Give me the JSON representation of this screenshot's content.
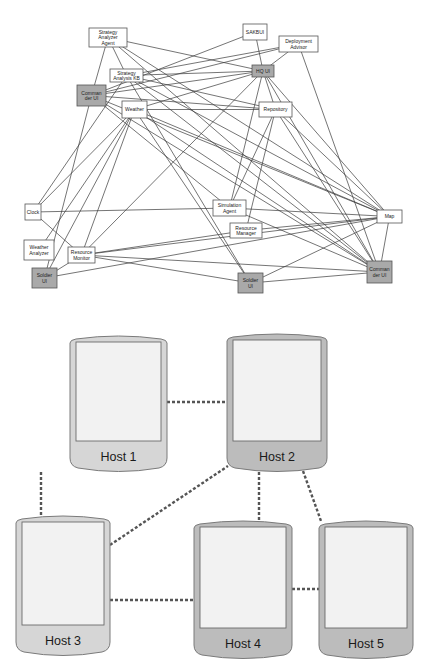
{
  "colors": {
    "edge": "#3a3a3a",
    "node_fill": "#ffffff",
    "node_stroke": "#555555",
    "ui_node_fill": "#a9a9a9",
    "host_shell_light": "#d6d6d6",
    "host_shell_dark": "#bcbcbc",
    "host_screen": "#f2f2f2",
    "host_stroke": "#7a7a7a",
    "dash": "#555555"
  },
  "agent_graph": {
    "nodes": [
      {
        "id": "sa_agent",
        "label": [
          "Strategy",
          "Analyzer",
          "Agent"
        ],
        "x": 89,
        "y": 28,
        "w": 38,
        "h": 19,
        "ui": false
      },
      {
        "id": "sakbui",
        "label": [
          "SAKBUI"
        ],
        "x": 243,
        "y": 24,
        "w": 24,
        "h": 16,
        "ui": false
      },
      {
        "id": "deploy",
        "label": [
          "Deployment",
          "Advisor"
        ],
        "x": 279,
        "y": 36,
        "w": 39,
        "h": 16,
        "ui": false
      },
      {
        "id": "sa_kb",
        "label": [
          "Strategy",
          "Analysis KB"
        ],
        "x": 110,
        "y": 69,
        "w": 33,
        "h": 13,
        "ui": false
      },
      {
        "id": "hq_ui",
        "label": [
          "HQ UI"
        ],
        "x": 252,
        "y": 65,
        "w": 22,
        "h": 12,
        "ui": true
      },
      {
        "id": "cmd_ui_l",
        "label": [
          "Comman",
          "der UI"
        ],
        "x": 77,
        "y": 85,
        "w": 29,
        "h": 21,
        "ui": true
      },
      {
        "id": "weather",
        "label": [
          "Weather"
        ],
        "x": 122,
        "y": 101,
        "w": 25,
        "h": 17,
        "ui": false
      },
      {
        "id": "repo",
        "label": [
          "Repository"
        ],
        "x": 259,
        "y": 102,
        "w": 33,
        "h": 15,
        "ui": false
      },
      {
        "id": "clock",
        "label": [
          "Clock"
        ],
        "x": 25,
        "y": 204,
        "w": 16,
        "h": 16,
        "ui": false
      },
      {
        "id": "sim",
        "label": [
          "Simulation",
          "Agent"
        ],
        "x": 213,
        "y": 200,
        "w": 33,
        "h": 16,
        "ui": false
      },
      {
        "id": "map",
        "label": [
          "Map"
        ],
        "x": 377,
        "y": 210,
        "w": 25,
        "h": 13,
        "ui": false
      },
      {
        "id": "res_mgr",
        "label": [
          "Resource",
          "Manager"
        ],
        "x": 230,
        "y": 223,
        "w": 32,
        "h": 15,
        "ui": false
      },
      {
        "id": "weather_an",
        "label": [
          "Weather",
          "Analyzer"
        ],
        "x": 24,
        "y": 240,
        "w": 30,
        "h": 20,
        "ui": false
      },
      {
        "id": "res_mon",
        "label": [
          "Resource",
          "Monitor"
        ],
        "x": 68,
        "y": 247,
        "w": 27,
        "h": 16,
        "ui": false
      },
      {
        "id": "soldier_l",
        "label": [
          "Soldier",
          "UI"
        ],
        "x": 32,
        "y": 268,
        "w": 25,
        "h": 20,
        "ui": true
      },
      {
        "id": "soldier_m",
        "label": [
          "Soldier",
          "UI"
        ],
        "x": 238,
        "y": 273,
        "w": 25,
        "h": 20,
        "ui": true
      },
      {
        "id": "cmd_ui_r",
        "label": [
          "Comman",
          "der UI"
        ],
        "x": 367,
        "y": 261,
        "w": 25,
        "h": 22,
        "ui": true
      }
    ],
    "edges": [
      [
        "sa_agent",
        "cmd_ui_l"
      ],
      [
        "sa_agent",
        "sa_kb"
      ],
      [
        "sa_agent",
        "map"
      ],
      [
        "sa_agent",
        "cmd_ui_r"
      ],
      [
        "sa_agent",
        "hq_ui"
      ],
      [
        "sakbui",
        "cmd_ui_l"
      ],
      [
        "sakbui",
        "hq_ui"
      ],
      [
        "deploy",
        "sa_kb"
      ],
      [
        "deploy",
        "hq_ui"
      ],
      [
        "deploy",
        "cmd_ui_l"
      ],
      [
        "deploy",
        "cmd_ui_r"
      ],
      [
        "sa_kb",
        "hq_ui"
      ],
      [
        "sa_kb",
        "repo"
      ],
      [
        "sa_kb",
        "clock"
      ],
      [
        "sa_kb",
        "soldier_m"
      ],
      [
        "sa_kb",
        "map"
      ],
      [
        "sa_kb",
        "cmd_ui_r"
      ],
      [
        "hq_ui",
        "cmd_ui_l"
      ],
      [
        "hq_ui",
        "weather"
      ],
      [
        "hq_ui",
        "repo"
      ],
      [
        "hq_ui",
        "res_mon"
      ],
      [
        "hq_ui",
        "sim"
      ],
      [
        "hq_ui",
        "map"
      ],
      [
        "hq_ui",
        "cmd_ui_r"
      ],
      [
        "cmd_ui_l",
        "repo"
      ],
      [
        "cmd_ui_l",
        "soldier_l"
      ],
      [
        "cmd_ui_l",
        "map"
      ],
      [
        "cmd_ui_l",
        "cmd_ui_r"
      ],
      [
        "cmd_ui_l",
        "sim"
      ],
      [
        "weather",
        "clock"
      ],
      [
        "weather",
        "weather_an"
      ],
      [
        "weather",
        "soldier_l"
      ],
      [
        "weather",
        "res_mon"
      ],
      [
        "weather",
        "repo"
      ],
      [
        "weather",
        "map"
      ],
      [
        "weather",
        "cmd_ui_r"
      ],
      [
        "weather",
        "soldier_m"
      ],
      [
        "repo",
        "sim"
      ],
      [
        "repo",
        "res_mgr"
      ],
      [
        "repo",
        "map"
      ],
      [
        "repo",
        "cmd_ui_r"
      ],
      [
        "clock",
        "sim"
      ],
      [
        "clock",
        "res_mon"
      ],
      [
        "sim",
        "map"
      ],
      [
        "sim",
        "cmd_ui_r"
      ],
      [
        "res_mgr",
        "map"
      ],
      [
        "res_mgr",
        "res_mon"
      ],
      [
        "res_mon",
        "map"
      ],
      [
        "res_mon",
        "cmd_ui_r"
      ],
      [
        "res_mon",
        "soldier_l"
      ],
      [
        "soldier_l",
        "map"
      ],
      [
        "soldier_m",
        "map"
      ],
      [
        "soldier_m",
        "res_mon"
      ],
      [
        "soldier_m",
        "cmd_ui_r"
      ],
      [
        "map",
        "cmd_ui_r"
      ]
    ]
  },
  "host_diagram": {
    "hosts": [
      {
        "id": "host1",
        "label": "Host 1",
        "x": 70,
        "y": 335,
        "w": 97,
        "h": 137,
        "shell": "light"
      },
      {
        "id": "host2",
        "label": "Host 2",
        "x": 227,
        "y": 333,
        "w": 100,
        "h": 139,
        "shell": "dark"
      },
      {
        "id": "host3",
        "label": "Host 3",
        "x": 16,
        "y": 515,
        "w": 94,
        "h": 141,
        "shell": "light"
      },
      {
        "id": "host4",
        "label": "Host 4",
        "x": 194,
        "y": 520,
        "w": 98,
        "h": 139,
        "shell": "dark"
      },
      {
        "id": "host5",
        "label": "Host 5",
        "x": 319,
        "y": 520,
        "w": 94,
        "h": 139,
        "shell": "dark"
      }
    ],
    "links": [
      {
        "from": [
          167,
          402
        ],
        "to": [
          227,
          402
        ]
      },
      {
        "from": [
          41,
          472
        ],
        "to": [
          41,
          515
        ]
      },
      {
        "from": [
          110,
          545
        ],
        "to": [
          228,
          466
        ]
      },
      {
        "from": [
          259,
          472
        ],
        "to": [
          259,
          520
        ]
      },
      {
        "from": [
          303,
          471
        ],
        "to": [
          321,
          521
        ]
      },
      {
        "from": [
          110,
          600
        ],
        "to": [
          194,
          600
        ]
      },
      {
        "from": [
          292,
          589
        ],
        "to": [
          319,
          589
        ]
      }
    ]
  }
}
